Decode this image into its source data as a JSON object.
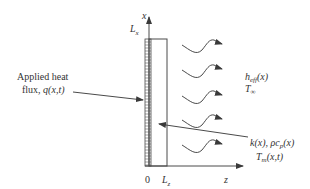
{
  "diagram": {
    "axes": {
      "x_axis_label": "x",
      "z_axis_label": "z",
      "origin_label": "0",
      "height_label": "L",
      "height_sub": "x",
      "width_label": "L",
      "width_sub": "z"
    },
    "left_annotation": {
      "line1": "Applied heat",
      "line2_prefix": "flux, ",
      "line2_func": "q(x,t)"
    },
    "right_top_annotation": {
      "h_label": "h",
      "h_sub": "eff",
      "h_arg": "(x)",
      "t_label": "T",
      "t_sub": "∞"
    },
    "right_bottom_annotation": {
      "line1": "k(x), ρc",
      "line1_sub": "p",
      "line1_arg": "(x)",
      "line2": "T",
      "line2_sub": "m",
      "line2_arg": "(x,t)"
    },
    "wavy_arrow_count": 5,
    "colors": {
      "stroke": "#4a4a4a",
      "text": "#333333"
    }
  }
}
